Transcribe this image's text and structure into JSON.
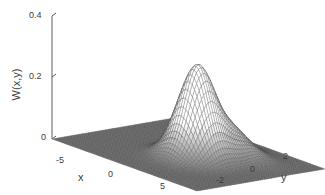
{
  "figure": {
    "name": "wigner-surface-plot",
    "background_color": "#ffffff",
    "line_color": "#444444"
  },
  "axes": {
    "z": {
      "title": "W(x,y)",
      "ticks": [
        "0.4",
        "0.2",
        "0"
      ],
      "range": [
        0,
        0.4
      ]
    },
    "x": {
      "title": "x",
      "ticks": [
        "-5",
        "0",
        "5"
      ],
      "range": [
        -8,
        8
      ]
    },
    "y": {
      "title": "y",
      "ticks": [
        "-2",
        "0",
        "2"
      ],
      "range": [
        -3.4,
        3.4
      ]
    }
  },
  "chart_data": {
    "type": "surface",
    "title": "",
    "xlabel": "x",
    "ylabel": "y",
    "zlabel": "W(x,y)",
    "xlim": [
      -8,
      8
    ],
    "ylim": [
      -3.4,
      3.4
    ],
    "zlim": [
      0,
      0.4
    ],
    "xticks": [
      -5,
      0,
      5
    ],
    "yticks": [
      -2,
      0,
      2
    ],
    "zticks": [
      0,
      0.2,
      0.4
    ],
    "grid": false,
    "legend": null,
    "view": {
      "azimuth": -37.5,
      "elevation": 30
    },
    "mesh": {
      "style": "wireframe-mesh",
      "shading": "grayscale",
      "nx": 61,
      "ny": 61
    },
    "peaks": [
      {
        "name": "main-peak",
        "x": 1.0,
        "y": 0.0,
        "z": 0.3,
        "sigma_x": 1.5,
        "sigma_y": 0.75
      },
      {
        "name": "secondary-ridge",
        "x": 1.0,
        "y": -1.6,
        "z": 0.075,
        "sigma_x": 2.2,
        "sigma_y": 0.6
      }
    ],
    "baseline": 0.0
  }
}
